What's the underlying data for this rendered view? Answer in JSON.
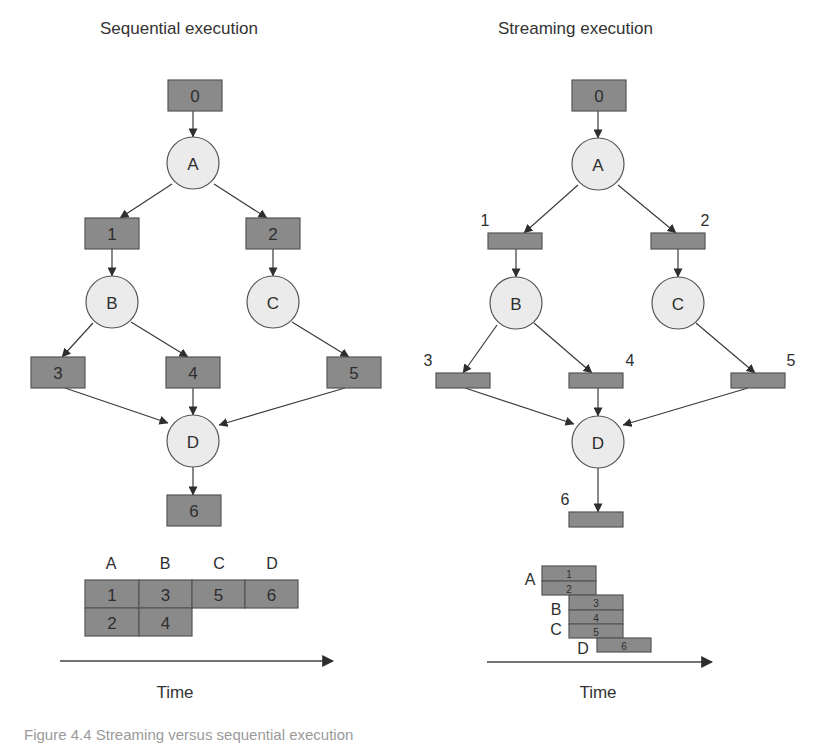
{
  "panels": [
    {
      "id": "sequential",
      "title": "Sequential execution",
      "title_pos": [
        100,
        34
      ],
      "boxes": [
        {
          "id": "0",
          "label": "0",
          "x": 168,
          "y": 80,
          "w": 54,
          "h": 31,
          "label_inside": true
        },
        {
          "id": "1",
          "label": "1",
          "x": 85,
          "y": 218,
          "w": 54,
          "h": 31,
          "label_inside": true
        },
        {
          "id": "2",
          "label": "2",
          "x": 246,
          "y": 218,
          "w": 54,
          "h": 31,
          "label_inside": true
        },
        {
          "id": "3",
          "label": "3",
          "x": 31,
          "y": 357,
          "w": 54,
          "h": 31,
          "label_inside": true
        },
        {
          "id": "4",
          "label": "4",
          "x": 166,
          "y": 357,
          "w": 54,
          "h": 31,
          "label_inside": true
        },
        {
          "id": "5",
          "label": "5",
          "x": 327,
          "y": 357,
          "w": 54,
          "h": 31,
          "label_inside": true
        },
        {
          "id": "6",
          "label": "6",
          "x": 167,
          "y": 495,
          "w": 54,
          "h": 31,
          "label_inside": true
        }
      ],
      "nodes": [
        {
          "id": "A",
          "label": "A",
          "cx": 193,
          "cy": 163,
          "r": 26
        },
        {
          "id": "B",
          "label": "B",
          "cx": 112,
          "cy": 302,
          "r": 26
        },
        {
          "id": "C",
          "label": "C",
          "cx": 273,
          "cy": 302,
          "r": 26
        },
        {
          "id": "D",
          "label": "D",
          "cx": 193,
          "cy": 441,
          "r": 26
        }
      ],
      "edges": [
        {
          "from": [
            193,
            111
          ],
          "to": [
            193,
            137
          ]
        },
        {
          "from": [
            172,
            184
          ],
          "to": [
            120,
            218
          ]
        },
        {
          "from": [
            214,
            184
          ],
          "to": [
            267,
            218
          ]
        },
        {
          "from": [
            112,
            249
          ],
          "to": [
            112,
            276
          ]
        },
        {
          "from": [
            273,
            249
          ],
          "to": [
            273,
            276
          ]
        },
        {
          "from": [
            93,
            323
          ],
          "to": [
            62,
            357
          ]
        },
        {
          "from": [
            131,
            322
          ],
          "to": [
            188,
            357
          ]
        },
        {
          "from": [
            292,
            322
          ],
          "to": [
            349,
            357
          ]
        },
        {
          "from": [
            65,
            388
          ],
          "to": [
            168,
            423
          ]
        },
        {
          "from": [
            193,
            388
          ],
          "to": [
            193,
            415
          ]
        },
        {
          "from": [
            345,
            388
          ],
          "to": [
            219,
            425
          ]
        },
        {
          "from": [
            193,
            467
          ],
          "to": [
            193,
            495
          ]
        }
      ],
      "timeline": {
        "phase_labels": [
          {
            "label": "A",
            "x": 111,
            "y": 569
          },
          {
            "label": "B",
            "x": 165,
            "y": 569
          },
          {
            "label": "C",
            "x": 219,
            "y": 569
          },
          {
            "label": "D",
            "x": 272,
            "y": 569
          }
        ],
        "cells": [
          {
            "label": "1",
            "x": 85,
            "y": 580,
            "w": 54,
            "h": 28
          },
          {
            "label": "3",
            "x": 139,
            "y": 580,
            "w": 53,
            "h": 28
          },
          {
            "label": "5",
            "x": 192,
            "y": 580,
            "w": 53,
            "h": 28
          },
          {
            "label": "6",
            "x": 245,
            "y": 580,
            "w": 53,
            "h": 28
          },
          {
            "label": "2",
            "x": 85,
            "y": 608,
            "w": 54,
            "h": 28
          },
          {
            "label": "4",
            "x": 139,
            "y": 608,
            "w": 53,
            "h": 28
          }
        ],
        "axis": {
          "x1": 60,
          "x2": 333,
          "y": 661
        },
        "axis_label": "Time",
        "axis_label_pos": [
          175,
          698
        ]
      }
    },
    {
      "id": "streaming",
      "title": "Streaming execution",
      "title_pos": [
        498,
        34
      ],
      "boxes": [
        {
          "id": "0",
          "label": "0",
          "x": 572,
          "y": 80,
          "w": 54,
          "h": 31,
          "label_inside": true
        },
        {
          "id": "1",
          "label": "1",
          "x": 488,
          "y": 233,
          "w": 54,
          "h": 16,
          "label_pos": [
            485,
            226
          ]
        },
        {
          "id": "2",
          "label": "2",
          "x": 651,
          "y": 233,
          "w": 54,
          "h": 16,
          "label_pos": [
            705,
            226
          ]
        },
        {
          "id": "3",
          "label": "3",
          "x": 436,
          "y": 373,
          "w": 54,
          "h": 15,
          "label_pos": [
            428,
            366
          ]
        },
        {
          "id": "4",
          "label": "4",
          "x": 569,
          "y": 373,
          "w": 54,
          "h": 15,
          "label_pos": [
            630,
            366
          ]
        },
        {
          "id": "5",
          "label": "5",
          "x": 731,
          "y": 373,
          "w": 54,
          "h": 15,
          "label_pos": [
            791,
            366
          ]
        },
        {
          "id": "6",
          "label": "6",
          "x": 569,
          "y": 512,
          "w": 54,
          "h": 15,
          "label_pos": [
            565,
            505
          ]
        }
      ],
      "nodes": [
        {
          "id": "A",
          "label": "A",
          "cx": 598,
          "cy": 164,
          "r": 26
        },
        {
          "id": "B",
          "label": "B",
          "cx": 516,
          "cy": 303,
          "r": 26
        },
        {
          "id": "C",
          "label": "C",
          "cx": 678,
          "cy": 303,
          "r": 26
        },
        {
          "id": "D",
          "label": "D",
          "cx": 598,
          "cy": 442,
          "r": 26
        }
      ],
      "edges": [
        {
          "from": [
            598,
            111
          ],
          "to": [
            598,
            138
          ]
        },
        {
          "from": [
            578,
            185
          ],
          "to": [
            524,
            233
          ]
        },
        {
          "from": [
            618,
            185
          ],
          "to": [
            676,
            233
          ]
        },
        {
          "from": [
            516,
            249
          ],
          "to": [
            516,
            277
          ]
        },
        {
          "from": [
            678,
            249
          ],
          "to": [
            678,
            277
          ]
        },
        {
          "from": [
            497,
            325
          ],
          "to": [
            463,
            373
          ]
        },
        {
          "from": [
            534,
            323
          ],
          "to": [
            592,
            373
          ]
        },
        {
          "from": [
            696,
            323
          ],
          "to": [
            755,
            373
          ]
        },
        {
          "from": [
            465,
            388
          ],
          "to": [
            574,
            424
          ]
        },
        {
          "from": [
            598,
            388
          ],
          "to": [
            598,
            416
          ]
        },
        {
          "from": [
            748,
            388
          ],
          "to": [
            623,
            425
          ]
        },
        {
          "from": [
            598,
            468
          ],
          "to": [
            598,
            512
          ]
        }
      ],
      "timeline": {
        "phase_labels": [
          {
            "label": "A",
            "x": 530,
            "y": 585
          },
          {
            "label": "B",
            "x": 556,
            "y": 615
          },
          {
            "label": "C",
            "x": 556,
            "y": 635
          },
          {
            "label": "D",
            "x": 583,
            "y": 654
          }
        ],
        "cells": [
          {
            "label": "1",
            "x": 542,
            "y": 566,
            "w": 54,
            "h": 15
          },
          {
            "label": "2",
            "x": 542,
            "y": 581,
            "w": 54,
            "h": 14
          },
          {
            "label": "3",
            "x": 569,
            "y": 595,
            "w": 54,
            "h": 15
          },
          {
            "label": "4",
            "x": 569,
            "y": 610,
            "w": 54,
            "h": 14
          },
          {
            "label": "5",
            "x": 569,
            "y": 624,
            "w": 54,
            "h": 14
          },
          {
            "label": "6",
            "x": 597,
            "y": 638,
            "w": 54,
            "h": 14
          }
        ],
        "axis": {
          "x1": 487,
          "x2": 712,
          "y": 662
        },
        "axis_label": "Time",
        "axis_label_pos": [
          598,
          698
        ]
      }
    }
  ],
  "caption": "Figure 4.4  Streaming versus sequential execution"
}
